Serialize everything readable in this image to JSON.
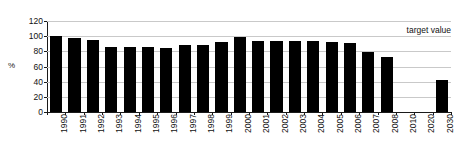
{
  "chart_data": {
    "type": "bar",
    "title": "",
    "xlabel": "",
    "ylabel": "%",
    "ylim": [
      0,
      120
    ],
    "ytick_step": 20,
    "yticks": [
      120,
      100,
      80,
      60,
      40,
      20,
      0
    ],
    "grid": true,
    "legend": "none",
    "bar_color": "#000000",
    "gridline_color": "#c9c9c9",
    "axis_color": "#1a1a1a",
    "categories": [
      "1990",
      "1991",
      "1992",
      "1993",
      "1994",
      "1995",
      "1996",
      "1997",
      "1998",
      "1999",
      "2000",
      "2001",
      "2002",
      "2003",
      "2004",
      "2005",
      "2006",
      "2007",
      "2008",
      "2010",
      "2020",
      "2030"
    ],
    "values": [
      100,
      98,
      95,
      86,
      86,
      86,
      84,
      88,
      88,
      92,
      99,
      94,
      93,
      94,
      94,
      92,
      91,
      79,
      72,
      null,
      null,
      42
    ],
    "annotations": [
      {
        "name": "target-value",
        "text": "target value",
        "y": 100,
        "x_category": "2030",
        "align": "right"
      }
    ]
  },
  "labels": {
    "y_axis_title": "%",
    "target_value": "target value"
  }
}
